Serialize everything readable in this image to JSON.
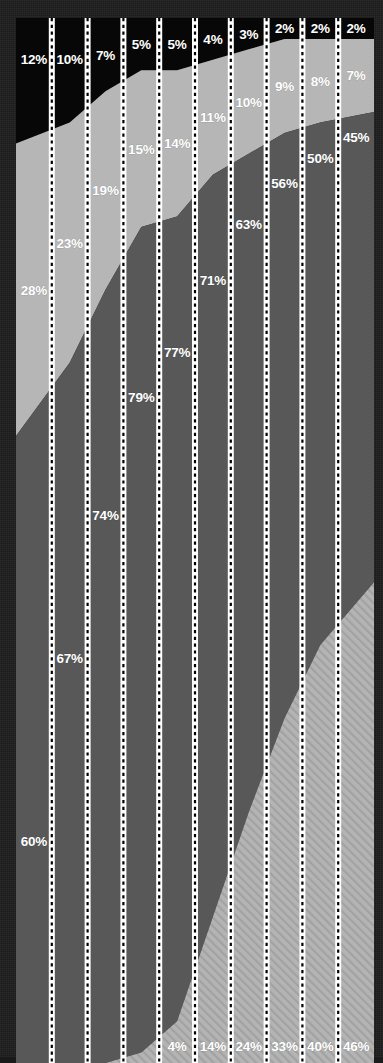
{
  "chart_data": {
    "type": "area",
    "stacked": true,
    "normalized_percent": true,
    "title": "",
    "subtitle": "",
    "xlabel": "",
    "ylabel": "",
    "ylim": [
      0,
      100
    ],
    "grid": true,
    "grid_style": "dotted-vertical-white",
    "legend": "none",
    "categories": [
      "1",
      "2",
      "3",
      "4",
      "5",
      "6",
      "7",
      "8",
      "9",
      "10"
    ],
    "x": [
      1,
      2,
      3,
      4,
      5,
      6,
      7,
      8,
      9,
      10
    ],
    "series": [
      {
        "name": "band-1-top-black",
        "color": "#070707",
        "fill": "solid",
        "values": [
          12,
          10,
          7,
          5,
          5,
          4,
          3,
          2,
          2,
          2
        ],
        "labels": [
          "12%",
          "10%",
          "7%",
          "5%",
          "5%",
          "4%",
          "3%",
          "2%",
          "2%",
          "2%"
        ]
      },
      {
        "name": "band-2-light-gray",
        "color": "#b6b6b6",
        "fill": "solid",
        "values": [
          28,
          23,
          19,
          15,
          14,
          11,
          10,
          9,
          8,
          7
        ],
        "labels": [
          "28%",
          "23%",
          "19%",
          "15%",
          "14%",
          "11%",
          "10%",
          "9%",
          "8%",
          "7%"
        ]
      },
      {
        "name": "band-3-dark-gray",
        "color": "#585858",
        "fill": "solid",
        "values": [
          60,
          67,
          74,
          79,
          77,
          71,
          63,
          56,
          50,
          45
        ],
        "labels": [
          "60%",
          "67%",
          "74%",
          "79%",
          "77%",
          "71%",
          "63%",
          "56%",
          "50%",
          "45%"
        ]
      },
      {
        "name": "band-4-bottom-hatched",
        "color": "#b0b0b0",
        "fill": "diagonal-hatch",
        "values": [
          0,
          0,
          0,
          1,
          4,
          14,
          24,
          33,
          40,
          46
        ],
        "labels": [
          "",
          "",
          "",
          "1%",
          "4%",
          "14%",
          "24%",
          "33%",
          "40%",
          "46%"
        ]
      }
    ],
    "data_labels": {
      "band_1": [
        "12%",
        "10%",
        "7%",
        "5%",
        "5%",
        "4%",
        "3%",
        "2%",
        "2%",
        "2%"
      ],
      "band_2": [
        "28%",
        "23%",
        "19%",
        "15%",
        "14%",
        "11%",
        "10%",
        "9%",
        "8%",
        "7%"
      ],
      "band_3": [
        "60%",
        "67%",
        "74%",
        "79%",
        "77%",
        "71%",
        "63%",
        "56%",
        "50%",
        "45%"
      ],
      "band_4": [
        "",
        "",
        "",
        "1%",
        "4%",
        "14%",
        "24%",
        "33%",
        "40%",
        "46%"
      ]
    }
  },
  "colors": {
    "background": "#1c1c1c",
    "band_1": "#070707",
    "band_2": "#b6b6b6",
    "band_3": "#585858",
    "band_4": "#b0b0b0",
    "gridline": "#ffffff",
    "gridline_dash": "#000000",
    "label_text": "#ffffff"
  }
}
